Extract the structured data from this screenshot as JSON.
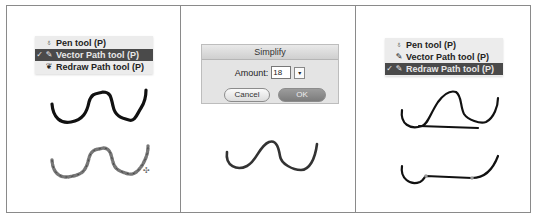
{
  "panels": [
    {
      "menu": {
        "items": [
          {
            "icon": "pen-icon",
            "glyph": "♁",
            "label": "Pen tool (P)",
            "checked": false,
            "selected": false
          },
          {
            "icon": "vector-path-icon",
            "glyph": "✎",
            "label": "Vector Path tool (P)",
            "checked": true,
            "selected": true
          },
          {
            "icon": "redraw-path-icon",
            "glyph": "❦",
            "label": "Redraw Path tool (P)",
            "checked": false,
            "selected": false
          }
        ]
      },
      "cursor_glyph": "✣"
    },
    {
      "dialog": {
        "title": "Simplify",
        "amount_label": "Amount:",
        "amount_value": "18",
        "dropdown_glyph": "▾",
        "cancel_label": "Cancel",
        "ok_label": "OK"
      }
    },
    {
      "menu": {
        "items": [
          {
            "icon": "pen-icon",
            "glyph": "♁",
            "label": "Pen tool (P)",
            "checked": false,
            "selected": false
          },
          {
            "icon": "vector-path-icon",
            "glyph": "✎",
            "label": "Vector Path tool (P)",
            "checked": false,
            "selected": false
          },
          {
            "icon": "redraw-path-icon",
            "glyph": "✎",
            "label": "Redraw Path tool (P)",
            "checked": true,
            "selected": true
          }
        ]
      }
    }
  ],
  "check_glyph": "✓",
  "colors": {
    "stroke": "#111111",
    "stroke_gray": "#777777",
    "highlight": "#4a4a4a",
    "border": "#8a8a8a"
  }
}
